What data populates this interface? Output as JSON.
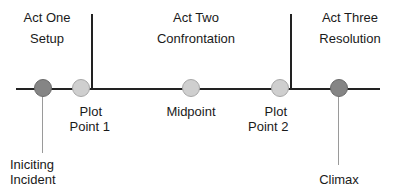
{
  "acts": [
    {
      "title": "Act One",
      "subtitle": "Setup"
    },
    {
      "title": "Act Two",
      "subtitle": "Confrontation"
    },
    {
      "title": "Act Three",
      "subtitle": "Resolution"
    }
  ],
  "points": [
    {
      "label_lines": [
        "Iniciting",
        "Incident"
      ],
      "style": "dark"
    },
    {
      "label_lines": [
        "Plot",
        "Point 1"
      ],
      "style": "light"
    },
    {
      "label_lines": [
        "Midpoint"
      ],
      "style": "light"
    },
    {
      "label_lines": [
        "Plot",
        "Point 2"
      ],
      "style": "light"
    },
    {
      "label_lines": [
        "Climax"
      ],
      "style": "dark"
    }
  ],
  "colors": {
    "line": "#222222",
    "light_point": "#cfcfcf",
    "dark_point": "#858585",
    "leader_line": "#9a9a9a"
  }
}
